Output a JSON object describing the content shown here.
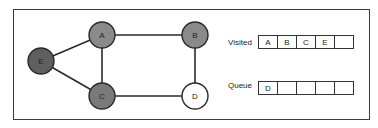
{
  "graph": {
    "nodes": [
      {
        "id": "E",
        "label": "E",
        "x": 41,
        "y": 61,
        "fill": "#5f5f5f",
        "state": "visited"
      },
      {
        "id": "A",
        "label": "A",
        "x": 102,
        "y": 35,
        "fill": "#8a8a8a",
        "state": "visited"
      },
      {
        "id": "B",
        "label": "B",
        "x": 195,
        "y": 35,
        "fill": "#8a8a8a",
        "state": "visited"
      },
      {
        "id": "C",
        "label": "C",
        "x": 102,
        "y": 96,
        "fill": "#7a7a7a",
        "state": "visited"
      },
      {
        "id": "D",
        "label": "D",
        "x": 195,
        "y": 96,
        "fill": "#ffffff",
        "state": "queued"
      }
    ],
    "edges": [
      [
        "E",
        "A"
      ],
      [
        "E",
        "C"
      ],
      [
        "A",
        "B"
      ],
      [
        "A",
        "C"
      ],
      [
        "B",
        "D"
      ],
      [
        "C",
        "D"
      ]
    ]
  },
  "visited": {
    "label": "Visited",
    "cells": [
      "A",
      "B",
      "C",
      "E",
      ""
    ]
  },
  "queue": {
    "label": "Queue",
    "cells": [
      "D",
      "",
      "",
      "",
      ""
    ]
  }
}
